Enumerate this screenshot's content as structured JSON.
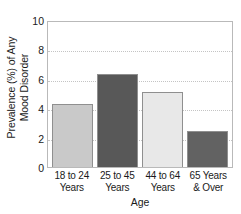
{
  "chart_data": {
    "type": "bar",
    "title": "",
    "xlabel": "Age",
    "ylabel": "Prevalence (%) of Any Mood Disorder",
    "ylabel_lines": [
      "Prevalence (%) of Any",
      "Mood Disorder"
    ],
    "categories": [
      "18 to 24 Years",
      "25 to 45 Years",
      "44 to 64 Years",
      "65 Years & Over"
    ],
    "category_lines": [
      [
        "18 to 24",
        "Years"
      ],
      [
        "25 to 45",
        "Years"
      ],
      [
        "44 to 64",
        "Years"
      ],
      [
        "65 Years",
        "& Over"
      ]
    ],
    "values": [
      4.3,
      6.3,
      5.1,
      2.45
    ],
    "bar_colors": [
      "#c9c9c9",
      "#585858",
      "#e8e8e8",
      "#626262"
    ],
    "bar_edge_color": "#8f8f8f",
    "ylim": [
      0,
      10
    ],
    "yticks": [
      0,
      2,
      4,
      6,
      8,
      10
    ],
    "ytick_labels": [
      "0",
      "2",
      "4",
      "6",
      "8",
      "10"
    ],
    "grid": true,
    "grid_color": "#c4c4c4",
    "grid_axis": "y",
    "legend": "none",
    "frame_color": "#b9b9b9"
  }
}
